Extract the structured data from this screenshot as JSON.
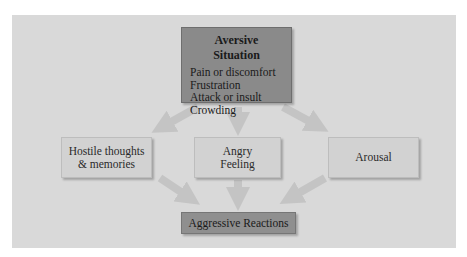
{
  "diagram": {
    "top_box": {
      "title": "Aversive Situation",
      "items": [
        "Pain or discomfort",
        "Frustration",
        "Attack or insult",
        "Crowding"
      ]
    },
    "middle_boxes": [
      {
        "line1": "Hostile thoughts",
        "line2": "& memories"
      },
      {
        "line1": "Angry",
        "line2": "Feeling"
      },
      {
        "line1": "Arousal",
        "line2": ""
      }
    ],
    "bottom_box": {
      "label": "Aggressive Reactions"
    },
    "colors": {
      "panel": "#d9d9d9",
      "top_box": "#8a8a8a",
      "middle_box": "#d2d2d2",
      "bottom_box": "#8f8f8f",
      "arrow": "#c4c4c4"
    }
  }
}
